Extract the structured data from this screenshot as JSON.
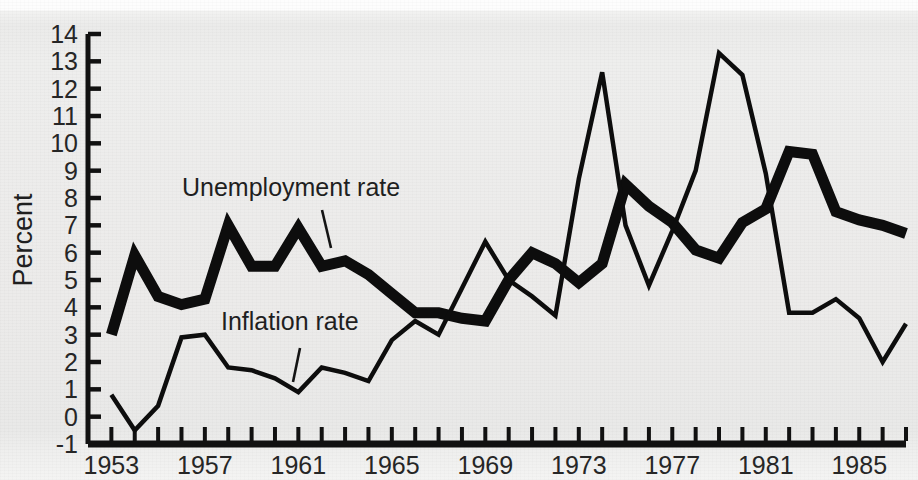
{
  "figure": {
    "background_color": "#ececeb",
    "ink_color": "#0d0d0d"
  },
  "chart_data": {
    "type": "line",
    "title": "",
    "subtitle": "",
    "xlabel": "",
    "ylabel": "Percent",
    "xlim": [
      1952,
      1987
    ],
    "ylim": [
      -1,
      14
    ],
    "grid": false,
    "legend_position": "inline-annotation",
    "y_ticks": [
      14,
      13,
      12,
      11,
      10,
      9,
      8,
      7,
      6,
      5,
      4,
      3,
      2,
      1,
      0,
      -1
    ],
    "y_tick_labels": [
      "14",
      "13",
      "12",
      "11",
      "10",
      "9",
      "8",
      "7",
      "6",
      "5",
      "4",
      "3",
      "2",
      "1",
      "0",
      "-1"
    ],
    "x_ticks": [
      1953,
      1957,
      1961,
      1965,
      1969,
      1973,
      1977,
      1981,
      1985
    ],
    "x_tick_labels": [
      "1953",
      "1957",
      "1961",
      "1965",
      "1969",
      "1973",
      "1977",
      "1981",
      "1985"
    ],
    "x_minor_tick_interval": 1,
    "x": [
      1953,
      1954,
      1955,
      1956,
      1957,
      1958,
      1959,
      1960,
      1961,
      1962,
      1963,
      1964,
      1965,
      1966,
      1967,
      1968,
      1969,
      1970,
      1971,
      1972,
      1973,
      1974,
      1975,
      1976,
      1977,
      1978,
      1979,
      1980,
      1981,
      1982,
      1983,
      1984,
      1985,
      1986,
      1987
    ],
    "series": [
      {
        "name": "Unemployment rate",
        "label": "Unemployment rate",
        "stroke_width": 11,
        "color": "#0d0d0d",
        "values": [
          3.0,
          5.9,
          4.4,
          4.1,
          4.3,
          7.0,
          5.5,
          5.5,
          6.9,
          5.5,
          5.7,
          5.2,
          4.5,
          3.8,
          3.8,
          3.6,
          3.5,
          5.0,
          6.0,
          5.6,
          4.9,
          5.6,
          8.5,
          7.7,
          7.1,
          6.1,
          5.8,
          7.1,
          7.6,
          9.7,
          9.6,
          7.5,
          7.2,
          7.0,
          6.7
        ]
      },
      {
        "name": "Inflation rate",
        "label": "Inflation rate",
        "stroke_width": 4.5,
        "color": "#0d0d0d",
        "values": [
          0.8,
          -0.5,
          0.4,
          2.9,
          3.0,
          1.8,
          1.7,
          1.4,
          0.9,
          1.8,
          1.6,
          1.3,
          2.8,
          3.5,
          3.0,
          4.7,
          6.4,
          5.0,
          4.4,
          3.7,
          8.7,
          12.6,
          7.0,
          4.8,
          6.8,
          9.0,
          13.3,
          12.5,
          8.9,
          3.8,
          3.8,
          4.3,
          3.6,
          2.0,
          3.4
        ]
      }
    ]
  },
  "annotations": [
    {
      "name": "unemployment-label",
      "text": "Unemployment rate",
      "x": 182,
      "y": 196,
      "leader": {
        "x1": 322,
        "y1": 210,
        "x2": 331,
        "y2": 248
      }
    },
    {
      "name": "inflation-label",
      "text": "Inflation rate",
      "x": 221,
      "y": 330,
      "leader": {
        "x1": 300,
        "y1": 348,
        "x2": 293,
        "y2": 382
      }
    }
  ]
}
